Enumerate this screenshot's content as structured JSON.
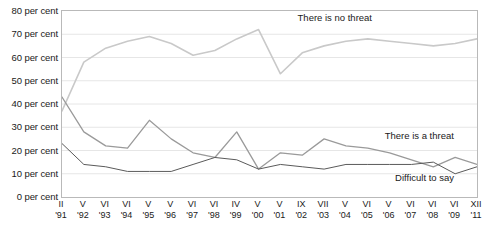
{
  "chart_data": {
    "type": "line",
    "title": "",
    "xlabel": "",
    "ylabel": "",
    "ylim": [
      0,
      80
    ],
    "ytick_step": 10,
    "grid": true,
    "legend_position": "inline-annotations",
    "ytick_labels": [
      "80 per cent",
      "70 per cent",
      "60 per cent",
      "50 per cent",
      "40 per cent",
      "30 per cent",
      "20 per cent",
      "10 per cent",
      "0 per cent"
    ],
    "ytick_values": [
      80,
      70,
      60,
      50,
      40,
      30,
      20,
      10,
      0
    ],
    "categories": [
      "II '91",
      "V '92",
      "VI '93",
      "VI '94",
      "V '95",
      "V '96",
      "VI '97",
      "VI '98",
      "IV '99",
      "V '00",
      "V '01",
      "IX '02",
      "VII '03",
      "V '04",
      "VI '05",
      "V '06",
      "VI '07",
      "VI '08",
      "VI '09",
      "XII '11"
    ],
    "x_tick_months": [
      "II",
      "V",
      "VI",
      "VI",
      "V",
      "V",
      "VI",
      "VI",
      "IV",
      "V",
      "V",
      "IX",
      "VII",
      "V",
      "VI",
      "V",
      "VI",
      "VI",
      "VI",
      "XII"
    ],
    "x_tick_years": [
      "'91",
      "'92",
      "'93",
      "'94",
      "'95",
      "'96",
      "'97",
      "'98",
      "'99",
      "'00",
      "'01",
      "'02",
      "'03",
      "'04",
      "'05",
      "'06",
      "'07",
      "'08",
      "'09",
      "'11"
    ],
    "series": [
      {
        "name": "There is no threat",
        "color": "#c9c9c9",
        "values": [
          37,
          58,
          64,
          67,
          69,
          66,
          61,
          63,
          68,
          72,
          53,
          62,
          65,
          67,
          68,
          67,
          66,
          65,
          66,
          68
        ]
      },
      {
        "name": "There is a threat",
        "color": "#9a9a9a",
        "values": [
          43,
          28,
          22,
          21,
          33,
          25,
          19,
          17,
          28,
          12,
          19,
          18,
          25,
          22,
          21,
          19,
          16,
          13,
          17,
          14
        ]
      },
      {
        "name": "Difficult to say",
        "color": "#5a5a5a",
        "values": [
          23,
          14,
          13,
          11,
          11,
          11,
          14,
          17,
          16,
          12,
          14,
          13,
          12,
          14,
          14,
          14,
          14,
          15,
          10,
          13
        ]
      }
    ],
    "annotations": [
      {
        "text": "There is no threat",
        "x_pct": 57.0,
        "y_px": 12
      },
      {
        "text": "There is a threat",
        "x_pct": 78.0,
        "y_px": 130
      },
      {
        "text": "Difficult to say",
        "x_pct": 80.5,
        "y_px": 172
      }
    ]
  }
}
